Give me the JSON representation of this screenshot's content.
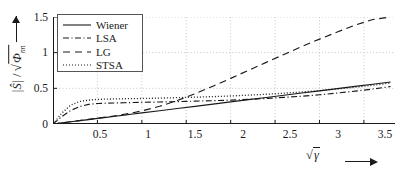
{
  "chart_data": {
    "type": "line",
    "title": "",
    "xlabel": "√γ",
    "ylabel": "|Ŝ| / √Φnn",
    "xlim": [
      0,
      3.85
    ],
    "ylim": [
      0,
      1.5
    ],
    "grid": true,
    "grid_style": "dotted",
    "legend_position": "upper-left",
    "xticks": [
      0.5,
      1,
      1.5,
      2,
      2.5,
      3,
      3.5
    ],
    "xtick_labels": [
      "0.5",
      "1",
      "1.5",
      "2",
      "2.5",
      "3",
      "3.5"
    ],
    "yticks": [
      0,
      0.5,
      1,
      1.5
    ],
    "ytick_labels": [
      "0",
      "0.5",
      "1",
      "1.5"
    ],
    "x": [
      0,
      0.1,
      0.2,
      0.3,
      0.4,
      0.5,
      0.6,
      0.7,
      0.8,
      0.9,
      1.0,
      1.2,
      1.4,
      1.6,
      1.8,
      2.0,
      2.2,
      2.4,
      2.6,
      2.8,
      3.0,
      3.2,
      3.4,
      3.6,
      3.8
    ],
    "series": [
      {
        "name": "Wiener",
        "style": "solid",
        "color": "#1a1a1a",
        "values": [
          0,
          0.016,
          0.031,
          0.047,
          0.062,
          0.078,
          0.093,
          0.109,
          0.124,
          0.14,
          0.155,
          0.186,
          0.217,
          0.248,
          0.279,
          0.31,
          0.341,
          0.372,
          0.403,
          0.434,
          0.465,
          0.496,
          0.527,
          0.558,
          0.589
        ]
      },
      {
        "name": "LSA",
        "style": "dash-dot",
        "color": "#1a1a1a",
        "values": [
          0,
          0.105,
          0.19,
          0.245,
          0.275,
          0.288,
          0.292,
          0.295,
          0.298,
          0.301,
          0.304,
          0.309,
          0.314,
          0.32,
          0.327,
          0.335,
          0.345,
          0.358,
          0.373,
          0.39,
          0.41,
          0.434,
          0.46,
          0.49,
          0.525
        ]
      },
      {
        "name": "LG",
        "style": "dashed",
        "color": "#1a1a1a",
        "values": [
          0,
          0.016,
          0.032,
          0.048,
          0.064,
          0.081,
          0.098,
          0.116,
          0.136,
          0.158,
          0.184,
          0.248,
          0.33,
          0.425,
          0.53,
          0.64,
          0.752,
          0.864,
          0.975,
          1.085,
          1.19,
          1.29,
          1.385,
          1.465,
          1.5
        ]
      },
      {
        "name": "STSA",
        "style": "dotted",
        "color": "#1a1a1a",
        "values": [
          0,
          0.155,
          0.265,
          0.315,
          0.335,
          0.345,
          0.349,
          0.352,
          0.354,
          0.356,
          0.358,
          0.363,
          0.369,
          0.376,
          0.384,
          0.393,
          0.404,
          0.417,
          0.432,
          0.449,
          0.468,
          0.49,
          0.515,
          0.543,
          0.575
        ]
      }
    ]
  },
  "legend": {
    "items": [
      {
        "label": "Wiener",
        "style": "solid"
      },
      {
        "label": "LSA",
        "style": "dash-dot"
      },
      {
        "label": "LG",
        "style": "dashed"
      },
      {
        "label": "STSA",
        "style": "dotted"
      }
    ]
  },
  "axes": {
    "y_axis_label": "|Ŝ|/√Φnn",
    "x_axis_label": "√γ"
  }
}
